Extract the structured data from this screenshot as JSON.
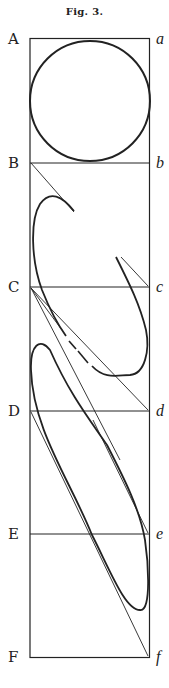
{
  "figure": {
    "title": "Fig. 3.",
    "left_labels": [
      "A",
      "B",
      "C",
      "D",
      "E",
      "F"
    ],
    "right_labels": [
      "a",
      "b",
      "c",
      "d",
      "e",
      "f"
    ],
    "colors": {
      "ink": "#222222",
      "paper": "#ffffff"
    }
  }
}
